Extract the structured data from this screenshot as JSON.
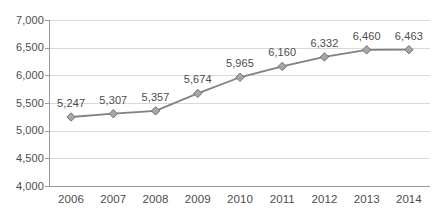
{
  "chart_data": {
    "type": "line",
    "title": "",
    "xlabel": "",
    "ylabel": "",
    "categories": [
      "2006",
      "2007",
      "2008",
      "2009",
      "2010",
      "2011",
      "2012",
      "2013",
      "2014"
    ],
    "values": [
      5247,
      5307,
      5357,
      5674,
      5965,
      6160,
      6332,
      6460,
      6463
    ],
    "data_labels": [
      "5,247",
      "5,307",
      "5,357",
      "5,674",
      "5,965",
      "6,160",
      "6,332",
      "6,460",
      "6,463"
    ],
    "ylim": [
      4000,
      7000
    ],
    "y_ticks": [
      7000,
      6500,
      6000,
      5500,
      5000,
      4500,
      4000
    ],
    "y_tick_labels": [
      "7,000",
      "6,500",
      "6,000",
      "5,500",
      "5,000",
      "4,500",
      "4,000"
    ],
    "grid": true,
    "legend": false,
    "legend_position": "none",
    "series": [
      {
        "name": "",
        "values": [
          5247,
          5307,
          5357,
          5674,
          5965,
          6160,
          6332,
          6460,
          6463
        ]
      }
    ],
    "colors": {
      "line": "#808080",
      "marker_fill": "#a6a6a6",
      "marker_stroke": "#737373",
      "gridline": "#d9d9d9",
      "axis": "#9a9a9a",
      "text": "#4d4d4d",
      "background": "#ffffff"
    },
    "marker_shape": "diamond"
  }
}
